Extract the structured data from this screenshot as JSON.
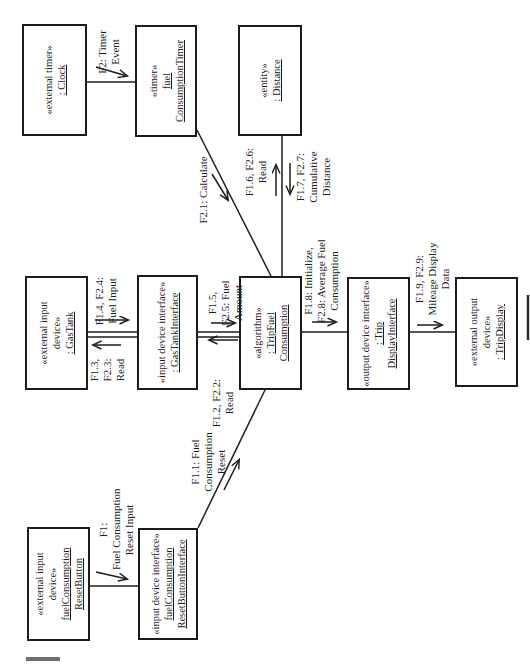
{
  "boxes": {
    "clock": {
      "lines": [
        "«external timer»",
        ": Clock"
      ]
    },
    "timer": {
      "lines": [
        "«timer»",
        "fuel",
        "ConsumptionTimer"
      ]
    },
    "distance": {
      "lines": [
        "«entity»",
        ": Distance"
      ]
    },
    "gas_tank": {
      "lines": [
        "«external input",
        "device»",
        ": GasTank"
      ]
    },
    "gas_tank_interface": {
      "lines": [
        "«input device interface»",
        ": GasTankInterface"
      ]
    },
    "trip_fuel_consumption": {
      "lines": [
        "«algorithm»",
        ": TripFuel",
        "Consumption"
      ]
    },
    "trip_display_interface": {
      "lines": [
        "«output device interface»",
        ": Trip",
        "DisplayInterface"
      ]
    },
    "trip_display": {
      "lines": [
        "«external output",
        "device»",
        ": TripDisplay"
      ]
    },
    "reset_button": {
      "lines": [
        "«external input",
        "device»",
        "fuelConsumption",
        "ResetButton"
      ]
    },
    "reset_button_interface": {
      "lines": [
        "«input device interface»",
        "fuelConsumption",
        "ResetButtonInterface"
      ]
    }
  },
  "messages": {
    "f2": {
      "lines": [
        "F2: Timer",
        "Event"
      ]
    },
    "f2_1": {
      "lines": [
        "F2.1: Calculate"
      ]
    },
    "f1_6": {
      "lines": [
        "F1.6, F2.6:",
        "Read"
      ]
    },
    "f1_7": {
      "lines": [
        "F1.7, F2.7:",
        "Cumulative",
        "Distance"
      ]
    },
    "f1_4": {
      "lines": [
        "F1.4, F2.4:",
        "Fuel Input"
      ]
    },
    "f1_3": {
      "lines": [
        "F1.3,",
        "F2.3:",
        "Read"
      ]
    },
    "f1_5": {
      "lines": [
        "F1.5,",
        "F2.5: Fuel",
        "Amount"
      ]
    },
    "f1_2": {
      "lines": [
        "F1.2, F2.2:",
        "Read"
      ]
    },
    "f1": {
      "lines": [
        "F1:",
        "Fuel Consumption",
        "Reset Input"
      ]
    },
    "f1_1": {
      "lines": [
        "F1.1: Fuel",
        "Consumption",
        "Reset"
      ]
    },
    "f1_8": {
      "lines": [
        "F1.8: Initialize,",
        "F2.8: Average Fuel",
        "Consumption"
      ]
    },
    "f1_9": {
      "lines": [
        "F1.9, F2.9:",
        "Mileage Display",
        "Data"
      ]
    }
  },
  "colors": {
    "ink": "#1c1c1c",
    "background": "#ffffff",
    "artifact_gray": "#6e6e6e"
  }
}
